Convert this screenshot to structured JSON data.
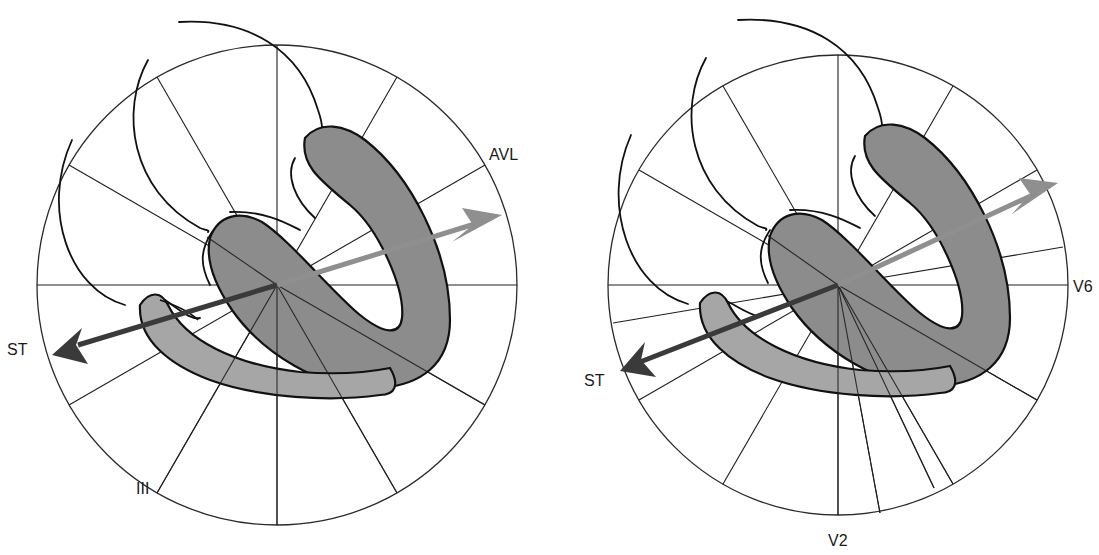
{
  "figure": {
    "panels": [
      {
        "id": "frontal-plane",
        "plane": "frontal (hexaxial)",
        "labels": {
          "avl": "AVL",
          "lead_iii": "III",
          "st": "ST"
        },
        "circle": {
          "cx": 277,
          "cy": 285,
          "r": 240
        },
        "injury_vector_color": "#8f8f8f",
        "st_vector_color": "#3a3a3a"
      },
      {
        "id": "horizontal-plane",
        "plane": "horizontal (precordial)",
        "labels": {
          "v6": "V6",
          "v2": "V2",
          "st": "ST"
        },
        "circle": {
          "cx": 838,
          "cy": 285,
          "r": 230
        },
        "injury_vector_color": "#8f8f8f",
        "st_vector_color": "#3a3a3a"
      }
    ],
    "colors": {
      "background": "#ffffff",
      "myocardium_fill": "#8c8c8c",
      "myocardium_fill_light": "#a6a6a6",
      "outline": "#111111"
    }
  }
}
